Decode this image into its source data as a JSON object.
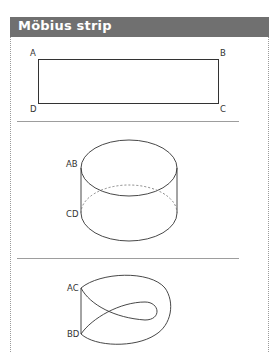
{
  "header": {
    "title": "Möbius strip"
  },
  "figures": {
    "rectangle": {
      "labels": {
        "top_left": "A",
        "top_right": "B",
        "bottom_left": "D",
        "bottom_right": "C"
      }
    },
    "cylinder": {
      "labels": {
        "top": "AB",
        "bottom": "CD"
      }
    },
    "mobius": {
      "labels": {
        "top": "AC",
        "bottom": "BD"
      }
    }
  },
  "colors": {
    "header_bg": "#707070",
    "header_text": "#ffffff",
    "line": "#333333",
    "divider": "#9d9d9d"
  }
}
